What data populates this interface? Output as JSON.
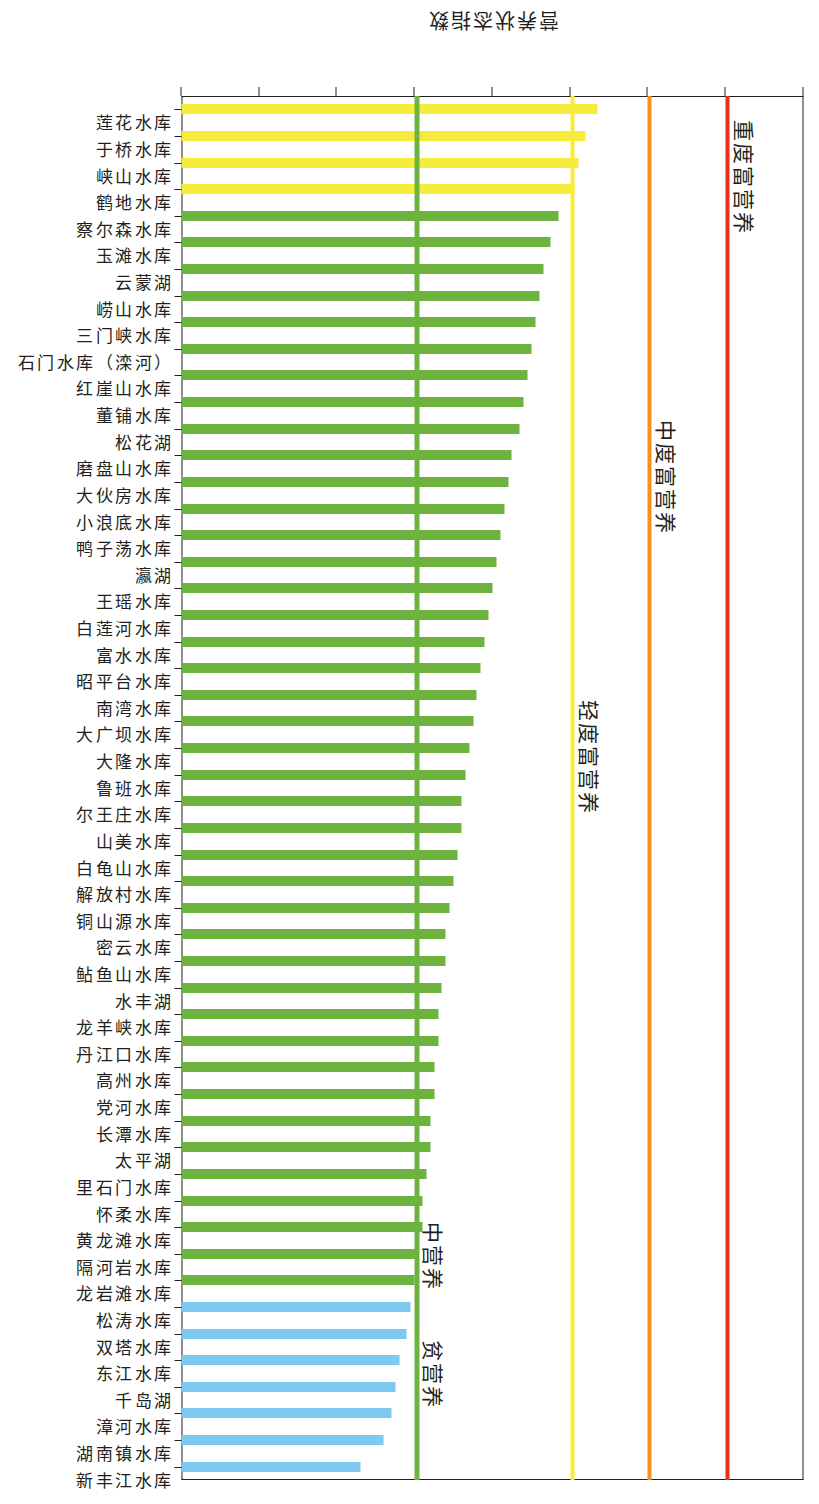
{
  "chart_data": {
    "type": "bar",
    "orientation": "vertical-rotated",
    "title": "",
    "xlabel": "",
    "ylabel": "营养状态指数",
    "ylim": [
      0,
      80
    ],
    "yticks": [
      0,
      10,
      20,
      30,
      40,
      50,
      60,
      70,
      80
    ],
    "grid": false,
    "legend": "none",
    "categories": [
      "莲花水库",
      "于桥水库",
      "峡山水库",
      "鹤地水库",
      "察尔森水库",
      "玉滩水库",
      "云蒙湖",
      "崂山水库",
      "三门峡水库",
      "石门水库（滦河）",
      "红崖山水库",
      "董铺水库",
      "松花湖",
      "磨盘山水库",
      "大伙房水库",
      "小浪底水库",
      "鸭子荡水库",
      "瀛湖",
      "王瑶水库",
      "白莲河水库",
      "富水水库",
      "昭平台水库",
      "南湾水库",
      "大广坝水库",
      "大隆水库",
      "鲁班水库",
      "尔王庄水库",
      "山美水库",
      "白龟山水库",
      "解放村水库",
      "铜山源水库",
      "密云水库",
      "鲇鱼山水库",
      "水丰湖",
      "龙羊峡水库",
      "丹江口水库",
      "高州水库",
      "党河水库",
      "长潭水库",
      "太平湖",
      "里石门水库",
      "怀柔水库",
      "黄龙滩水库",
      "隔河岩水库",
      "龙岩滩水库",
      "松涛水库",
      "双塔水库",
      "东江水库",
      "千岛湖",
      "漳河水库",
      "湖南镇水库",
      "新丰江水库"
    ],
    "values": [
      53.5,
      52.0,
      51.0,
      50.5,
      48.5,
      47.5,
      46.5,
      46.0,
      45.5,
      45.0,
      44.5,
      44.0,
      43.5,
      42.5,
      42.0,
      41.5,
      41.0,
      40.5,
      40.0,
      39.5,
      39.0,
      38.5,
      38.0,
      37.5,
      37.0,
      36.5,
      36.0,
      36.0,
      35.5,
      35.0,
      34.5,
      34.0,
      34.0,
      33.5,
      33.0,
      33.0,
      32.5,
      32.5,
      32.0,
      32.0,
      31.5,
      31.0,
      31.0,
      30.5,
      30.0,
      29.5,
      29.0,
      28.0,
      27.5,
      27.0,
      26.0,
      23.0
    ],
    "colors": [
      "#f7ec3c",
      "#f7ec3c",
      "#f7ec3c",
      "#f7ec3c",
      "#6cb33f",
      "#6cb33f",
      "#6cb33f",
      "#6cb33f",
      "#6cb33f",
      "#6cb33f",
      "#6cb33f",
      "#6cb33f",
      "#6cb33f",
      "#6cb33f",
      "#6cb33f",
      "#6cb33f",
      "#6cb33f",
      "#6cb33f",
      "#6cb33f",
      "#6cb33f",
      "#6cb33f",
      "#6cb33f",
      "#6cb33f",
      "#6cb33f",
      "#6cb33f",
      "#6cb33f",
      "#6cb33f",
      "#6cb33f",
      "#6cb33f",
      "#6cb33f",
      "#6cb33f",
      "#6cb33f",
      "#6cb33f",
      "#6cb33f",
      "#6cb33f",
      "#6cb33f",
      "#6cb33f",
      "#6cb33f",
      "#6cb33f",
      "#6cb33f",
      "#6cb33f",
      "#6cb33f",
      "#6cb33f",
      "#6cb33f",
      "#6cb33f",
      "#7ec8ef",
      "#7ec8ef",
      "#7ec8ef",
      "#7ec8ef",
      "#7ec8ef",
      "#7ec8ef",
      "#7ec8ef"
    ],
    "reference_lines": [
      {
        "label": "重度富营养",
        "value": 70,
        "color": "#e8301c"
      },
      {
        "label": "中度富营养",
        "value": 60,
        "color": "#f4901e"
      },
      {
        "label": "轻度富营养",
        "value": 50,
        "color": "#f7ec3c"
      },
      {
        "label": "中营养",
        "value": 30,
        "color": "#6cb33f"
      },
      {
        "label": "贫营养",
        "value": 30,
        "color": "#6cb33f"
      }
    ],
    "annotations": [
      {
        "text": "重度富营养",
        "at_value": 70
      },
      {
        "text": "中度富营养",
        "at_value": 60
      },
      {
        "text": "轻度富营养",
        "at_value": 50
      },
      {
        "text": "中营养",
        "at_value": 30
      },
      {
        "text": "贫营养",
        "at_value": 30
      }
    ],
    "trophic_palette": {
      "oligotrophic": "#7ec8ef",
      "mesotrophic": "#6cb33f",
      "light_eutrophic": "#f7ec3c",
      "moderate_eutrophic": "#f4901e",
      "severe_eutrophic": "#e8301c"
    }
  },
  "axis": {
    "value_axis_title": "营养状态指数"
  }
}
